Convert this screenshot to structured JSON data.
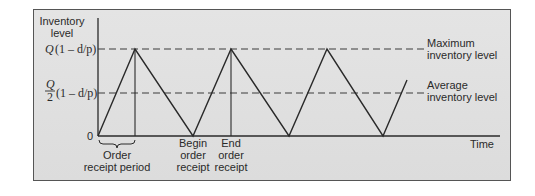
{
  "diagram": {
    "y_axis_label_line1": "Inventory",
    "y_axis_label_line2": "level",
    "x_axis_label": "Time",
    "y_ticks": {
      "max": {
        "prefix": "Q",
        "expr": "(1 – d/p)"
      },
      "avg": {
        "num": "Q",
        "den": "2",
        "expr": "(1 – d/p)"
      },
      "zero": "0"
    },
    "right_labels": {
      "max_line1": "Maximum",
      "max_line2": "inventory level",
      "avg_line1": "Average",
      "avg_line2": "inventory level"
    },
    "bottom_labels": {
      "order_receipt_line1": "Order",
      "order_receipt_line2": "receipt period",
      "begin_line1": "Begin",
      "begin_line2": "order",
      "begin_line3": "receipt",
      "end_line1": "End",
      "end_line2": "order",
      "end_line3": "receipt"
    },
    "colors": {
      "background": "#dedede",
      "line": "#2a2a2a",
      "frame": "#555555"
    }
  }
}
